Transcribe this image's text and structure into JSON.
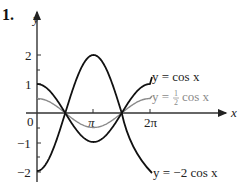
{
  "problem_number": "1.",
  "chart_data": {
    "type": "line",
    "title": "",
    "xlabel": "x",
    "ylabel": "y",
    "xlim": [
      0,
      6.5
    ],
    "ylim": [
      -2.2,
      2.8
    ],
    "x_ticks": [
      {
        "value": 3.14159,
        "label": "π"
      },
      {
        "value": 6.28318,
        "label": "2π"
      }
    ],
    "y_ticks": [
      {
        "value": 2,
        "label": "2"
      },
      {
        "value": 1,
        "label": "1"
      },
      {
        "value": 0,
        "label": "0"
      },
      {
        "value": -1,
        "label": "−1"
      },
      {
        "value": -2,
        "label": "−2"
      }
    ],
    "grid": false,
    "series": [
      {
        "name": "y = cos x",
        "function": "cos(x)",
        "color": "#111111",
        "domain": [
          0,
          6.28318
        ]
      },
      {
        "name": "y = 1/2 cos x",
        "function": "0.5*cos(x)",
        "color": "#8a8a8a",
        "domain": [
          0,
          6.28318
        ]
      },
      {
        "name": "y = −2 cos x",
        "function": "-2*cos(x)",
        "color": "#111111",
        "domain": [
          0,
          6.28318
        ]
      }
    ],
    "annotations": [
      {
        "text": "y = cos x",
        "for": "cos(x)"
      },
      {
        "text": "y = 1/2 cos x",
        "for": "0.5*cos(x)"
      },
      {
        "text": "y = −2 cos x",
        "for": "-2*cos(x)"
      }
    ]
  },
  "labels": {
    "y_axis": "y",
    "x_axis": "x",
    "origin": "0",
    "tick_pi": "π",
    "tick_2pi": "2π",
    "y2": "2",
    "y1": "1",
    "yn1": "−1",
    "yn2": "−2",
    "cos_label": "y = cos x",
    "half_cos_prefix": "y = ",
    "half_num": "1",
    "half_den": "2",
    "half_cos_suffix": "cos x",
    "neg2cos_label": "y = −2 cos x"
  }
}
